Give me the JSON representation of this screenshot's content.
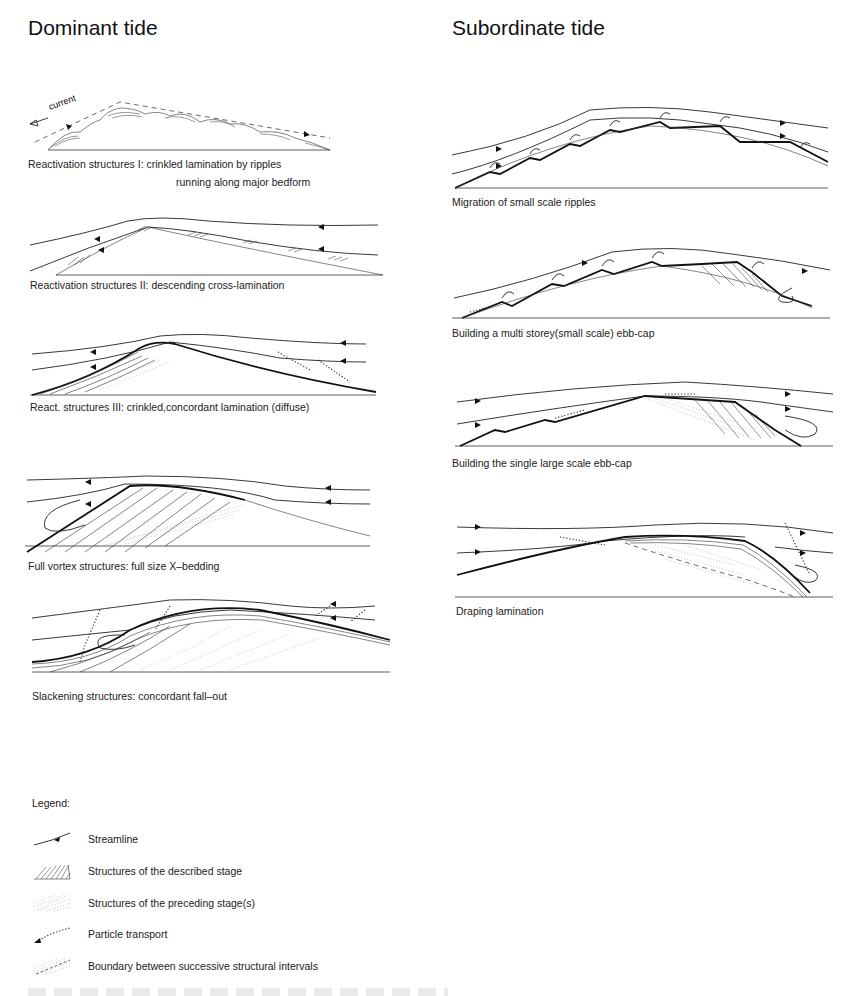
{
  "columns": {
    "left": {
      "title": "Dominant tide"
    },
    "right": {
      "title": "Subordinate tide"
    }
  },
  "panels": {
    "dominant": [
      {
        "caption": "Reactivation structures I:   crinkled lamination by ripples",
        "caption2": "running along major bedform",
        "annotation": "current"
      },
      {
        "caption": "Reactivation structures II: descending cross-lamination"
      },
      {
        "caption": "React. structures III:   crinkled,concordant lamination (diffuse)"
      },
      {
        "caption": "Full vortex structures: full size X–bedding"
      },
      {
        "caption": "Slackening structures: concordant fall–out"
      }
    ],
    "subordinate": [
      {
        "caption": "Migration of small scale ripples"
      },
      {
        "caption": "Building a multi storey(small scale) ebb-cap"
      },
      {
        "caption": "Building the single large scale ebb-cap"
      },
      {
        "caption": "Draping lamination"
      }
    ]
  },
  "legend": {
    "title": "Legend:",
    "items": [
      {
        "symbol": "streamline-icon",
        "label": "Streamline"
      },
      {
        "symbol": "hatched-structure-icon",
        "label": "Structures of the described stage"
      },
      {
        "symbol": "stippled-structure-icon",
        "label": "Structures of the preceding stage(s)"
      },
      {
        "symbol": "particle-transport-icon",
        "label": "Particle transport"
      },
      {
        "symbol": "boundary-icon",
        "label": "Boundary between successive structural intervals"
      }
    ]
  }
}
